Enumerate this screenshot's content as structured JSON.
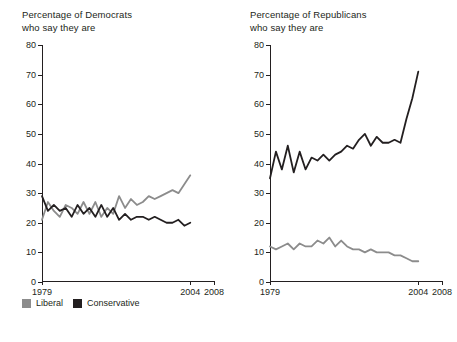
{
  "legend": {
    "items": [
      {
        "label": "Liberal",
        "color": "#8c8c8c"
      },
      {
        "label": "Conservative",
        "color": "#231f20"
      }
    ]
  },
  "chart_data": [
    {
      "type": "line",
      "title": "Percentage of Democrats",
      "subtitle": "who say they are",
      "xlabel": "",
      "ylabel": "",
      "ylim": [
        0,
        80
      ],
      "yticks": [
        0,
        10,
        20,
        30,
        40,
        50,
        60,
        70,
        80
      ],
      "xlim": [
        1979,
        2008
      ],
      "xticks": [
        1979,
        2004,
        2008
      ],
      "xtick_labels": [
        "1979",
        "2004",
        "2008"
      ],
      "grid": false,
      "legend_position": "below",
      "x": [
        1979,
        1980,
        1981,
        1982,
        1983,
        1984,
        1985,
        1986,
        1987,
        1988,
        1989,
        1990,
        1991,
        1992,
        1993,
        1994,
        1995,
        1996,
        1997,
        1998,
        1999,
        2000,
        2001,
        2002,
        2003,
        2004
      ],
      "series": [
        {
          "name": "Liberal",
          "color": "#8c8c8c",
          "values": [
            21,
            27,
            24,
            22,
            26,
            25,
            23,
            27,
            23,
            27,
            22,
            25,
            23,
            29,
            25,
            28,
            26,
            27,
            29,
            28,
            29,
            30,
            31,
            30,
            33,
            36
          ]
        },
        {
          "name": "Conservative",
          "color": "#231f20",
          "values": [
            29,
            24,
            26,
            24,
            25,
            22,
            26,
            23,
            25,
            22,
            26,
            22,
            25,
            21,
            23,
            21,
            22,
            22,
            21,
            22,
            21,
            20,
            20,
            21,
            19,
            20
          ]
        }
      ]
    },
    {
      "type": "line",
      "title": "Percentage of Republicans",
      "subtitle": "who say they are",
      "xlabel": "",
      "ylabel": "",
      "ylim": [
        0,
        80
      ],
      "yticks": [
        0,
        10,
        20,
        30,
        40,
        50,
        60,
        70,
        80
      ],
      "xlim": [
        1979,
        2008
      ],
      "xticks": [
        1979,
        2004,
        2008
      ],
      "xtick_labels": [
        "1979",
        "2004",
        "2008"
      ],
      "grid": false,
      "legend_position": "below",
      "x": [
        1979,
        1980,
        1981,
        1982,
        1983,
        1984,
        1985,
        1986,
        1987,
        1988,
        1989,
        1990,
        1991,
        1992,
        1993,
        1994,
        1995,
        1996,
        1997,
        1998,
        1999,
        2000,
        2001,
        2002,
        2003,
        2004
      ],
      "series": [
        {
          "name": "Liberal",
          "color": "#8c8c8c",
          "values": [
            12,
            11,
            12,
            13,
            11,
            13,
            12,
            12,
            14,
            13,
            15,
            12,
            14,
            12,
            11,
            11,
            10,
            11,
            10,
            10,
            10,
            9,
            9,
            8,
            7,
            7
          ]
        },
        {
          "name": "Conservative",
          "color": "#231f20",
          "values": [
            35,
            44,
            38,
            46,
            37,
            44,
            38,
            42,
            41,
            43,
            41,
            43,
            44,
            46,
            45,
            48,
            50,
            46,
            49,
            47,
            47,
            48,
            47,
            55,
            62,
            71
          ]
        }
      ]
    }
  ]
}
